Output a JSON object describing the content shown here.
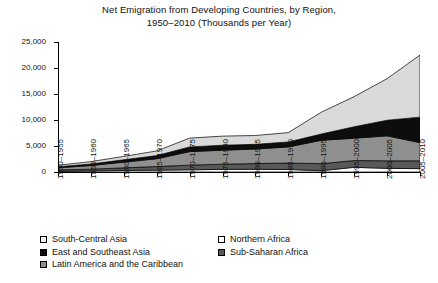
{
  "title": {
    "line1": "Net Emigration from Developing Countries, by Region,",
    "line2": "1950–2010 (Thousands per Year)"
  },
  "axes": {
    "y_ticks": [
      "0",
      "5,000",
      "10,000",
      "15,000",
      "20,000",
      "25,000"
    ],
    "y_values": [
      0,
      5000,
      10000,
      15000,
      20000,
      25000
    ],
    "ylim": [
      0,
      25000
    ],
    "ylabel": "",
    "xlabel": ""
  },
  "legend": {
    "left_column": [
      {
        "label": "South-Central Asia",
        "swatch": "#f2f2f2"
      },
      {
        "label": "East and Southeast Asia",
        "swatch": "#0d0d0d"
      },
      {
        "label": "Latin America and the Caribbean",
        "swatch": "#8f8f8f"
      }
    ],
    "right_column": [
      {
        "label": "Northern Africa",
        "swatch": "#ffffff"
      },
      {
        "label": "Sub-Saharan Africa",
        "swatch": "#595959"
      }
    ]
  },
  "chart_data": {
    "type": "area",
    "stacked": true,
    "title": "Net Emigration from Developing Countries, by Region, 1950–2010 (Thousands per Year)",
    "xlabel": "",
    "ylabel": "",
    "ylim": [
      0,
      25000
    ],
    "grid": false,
    "legend_position": "bottom",
    "categories": [
      "1950–1955",
      "1955–1960",
      "1960–1965",
      "1965–1970",
      "1970–1975",
      "1975–1980",
      "1980–1985",
      "1985–1990",
      "1990–1995",
      "1995–2000",
      "2000–2005",
      "2005–2010"
    ],
    "stack_order_bottom_to_top": [
      "Northern Africa",
      "Sub-Saharan Africa",
      "Latin America and the Caribbean",
      "East and Southeast Asia",
      "South-Central Asia"
    ],
    "series": [
      {
        "name": "Northern Africa",
        "color": "#ffffff",
        "values": [
          150,
          200,
          300,
          350,
          420,
          500,
          520,
          480,
          250,
          900,
          700,
          650
        ]
      },
      {
        "name": "Sub-Saharan Africa",
        "color": "#595959",
        "values": [
          250,
          350,
          500,
          700,
          900,
          1000,
          1100,
          1250,
          1350,
          1300,
          1450,
          1500
        ]
      },
      {
        "name": "Latin America and the Caribbean",
        "color": "#8f8f8f",
        "values": [
          400,
          700,
          1100,
          1500,
          2600,
          2700,
          2800,
          3100,
          4500,
          4300,
          4800,
          3500
        ]
      },
      {
        "name": "East and Southeast Asia",
        "color": "#0d0d0d",
        "values": [
          200,
          300,
          450,
          600,
          900,
          950,
          900,
          950,
          1200,
          2200,
          3000,
          4900
        ]
      },
      {
        "name": "South-Central Asia",
        "color": "#d9d9d9",
        "values": [
          300,
          450,
          650,
          900,
          1700,
          1750,
          1700,
          1800,
          4200,
          5800,
          8000,
          11950
        ]
      }
    ],
    "totals": [
      1300,
      2000,
      3000,
      4050,
      6520,
      6900,
      7020,
      7580,
      11500,
      14500,
      17950,
      22500
    ]
  }
}
